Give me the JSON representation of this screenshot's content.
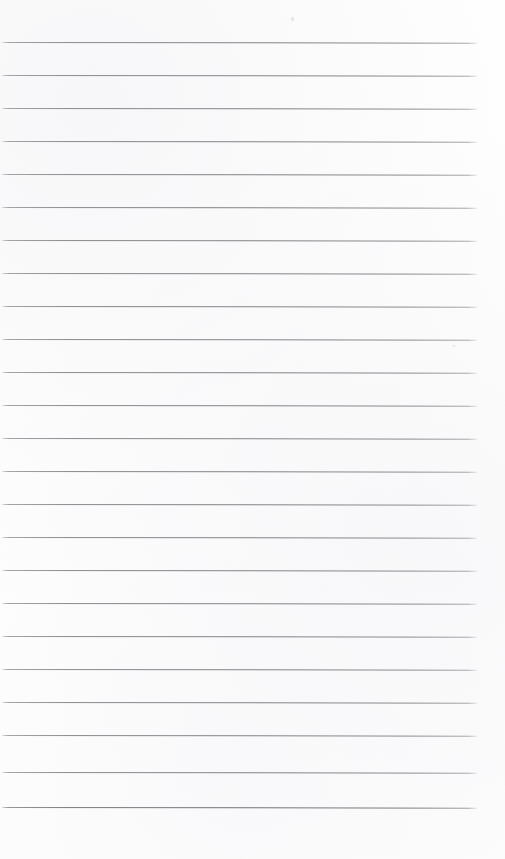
{
  "page": {
    "kind": "scanned-blank-ruled-notebook-page",
    "width": 505,
    "height": 859,
    "background_color": "#ffffff",
    "written_text": "",
    "has_text_content": false,
    "orientation": "portrait"
  },
  "ruling": {
    "line_color": "#828287",
    "line_count": 24,
    "first_line_y": 42,
    "line_spacing": 33.2,
    "line_thickness": 1,
    "line_start_x": 2,
    "line_end_x": 477,
    "top_margin": 42,
    "bottom_margin": 50,
    "skew_degrees": 0.08,
    "lines": [
      {
        "index": 1,
        "y": 42,
        "x1": 2,
        "x2": 477,
        "weight": "normal"
      },
      {
        "index": 2,
        "y": 75,
        "x1": 2,
        "x2": 477,
        "weight": "normal"
      },
      {
        "index": 3,
        "y": 108,
        "x1": 2,
        "x2": 477,
        "weight": "normal"
      },
      {
        "index": 4,
        "y": 141,
        "x1": 2,
        "x2": 477,
        "weight": "normal"
      },
      {
        "index": 5,
        "y": 174,
        "x1": 2,
        "x2": 477,
        "weight": "normal"
      },
      {
        "index": 6,
        "y": 207,
        "x1": 2,
        "x2": 477,
        "weight": "normal"
      },
      {
        "index": 7,
        "y": 240,
        "x1": 2,
        "x2": 477,
        "weight": "normal"
      },
      {
        "index": 8,
        "y": 273,
        "x1": 2,
        "x2": 477,
        "weight": "normal"
      },
      {
        "index": 9,
        "y": 306,
        "x1": 2,
        "x2": 477,
        "weight": "normal"
      },
      {
        "index": 10,
        "y": 339,
        "x1": 2,
        "x2": 477,
        "weight": "normal"
      },
      {
        "index": 11,
        "y": 372,
        "x1": 2,
        "x2": 477,
        "weight": "normal"
      },
      {
        "index": 12,
        "y": 405,
        "x1": 2,
        "x2": 477,
        "weight": "normal"
      },
      {
        "index": 13,
        "y": 438,
        "x1": 2,
        "x2": 477,
        "weight": "normal"
      },
      {
        "index": 14,
        "y": 471,
        "x1": 2,
        "x2": 477,
        "weight": "normal"
      },
      {
        "index": 15,
        "y": 504,
        "x1": 2,
        "x2": 477,
        "weight": "normal"
      },
      {
        "index": 16,
        "y": 537,
        "x1": 2,
        "x2": 477,
        "weight": "normal"
      },
      {
        "index": 17,
        "y": 570,
        "x1": 2,
        "x2": 477,
        "weight": "normal"
      },
      {
        "index": 18,
        "y": 603,
        "x1": 2,
        "x2": 477,
        "weight": "normal"
      },
      {
        "index": 19,
        "y": 636,
        "x1": 2,
        "x2": 477,
        "weight": "normal"
      },
      {
        "index": 20,
        "y": 669,
        "x1": 2,
        "x2": 477,
        "weight": "normal"
      },
      {
        "index": 21,
        "y": 702,
        "x1": 2,
        "x2": 477,
        "weight": "normal"
      },
      {
        "index": 22,
        "y": 735,
        "x1": 2,
        "x2": 477,
        "weight": "normal"
      },
      {
        "index": 23,
        "y": 772,
        "x1": 2,
        "x2": 477,
        "weight": "normal"
      },
      {
        "index": 24,
        "y": 807,
        "x1": 2,
        "x2": 477,
        "weight": "heavy"
      }
    ]
  },
  "artifacts": [
    {
      "name": "dust-speck",
      "x": 291,
      "y": 17,
      "color": "#e4e4e8"
    },
    {
      "name": "dust-speck-2",
      "x": 452,
      "y": 345,
      "color": "#ececef"
    }
  ]
}
